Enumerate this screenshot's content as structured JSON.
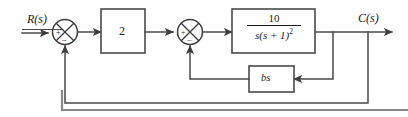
{
  "diagram": {
    "type": "control-system-block-diagram",
    "signals": {
      "input": {
        "label": "R(s)",
        "name": "reference-input"
      },
      "output": {
        "label": "C(s)",
        "name": "controlled-output"
      }
    },
    "blocks": [
      {
        "id": "gain",
        "name": "gain-block",
        "label": "2",
        "kind": "gain"
      },
      {
        "id": "plant",
        "name": "plant-transfer-function-block",
        "kind": "transfer-function",
        "numerator": "10",
        "denominator_base": "s(s + 1)",
        "denominator_exponent": "2",
        "label": "10 / s(s + 1)^2"
      },
      {
        "id": "rate-feedback",
        "name": "rate-feedback-block",
        "label": "bs",
        "kind": "feedback-gain"
      }
    ],
    "summing_junctions": [
      {
        "id": "sum1",
        "name": "summing-junction-outer",
        "input_sign": "+",
        "feedback_sign": "−"
      },
      {
        "id": "sum2",
        "name": "summing-junction-inner",
        "input_sign": "+",
        "feedback_sign": "−"
      }
    ],
    "loops": [
      {
        "name": "inner-rate-feedback-loop",
        "from": "plant-output",
        "through": "rate-feedback-block",
        "to": "summing-junction-inner"
      },
      {
        "name": "outer-unity-feedback-loop",
        "from": "plant-output",
        "through": "unity",
        "to": "summing-junction-outer"
      }
    ],
    "colors": {
      "wire": "#4a4a4a",
      "box_stroke": "#4a4a4a",
      "text": "#1a1a1a",
      "background": "#ffffff",
      "frame": "#888888"
    }
  }
}
